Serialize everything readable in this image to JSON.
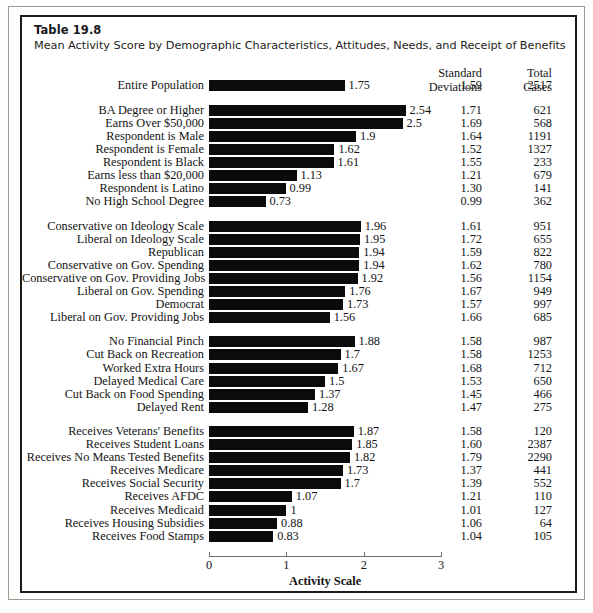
{
  "table": {
    "number_label": "Table 19.8",
    "caption": "Mean Activity Score by Demographic Characteristics, Attitudes, Needs, and Receipt of Benefits",
    "columns": {
      "sd_line1": "Standard",
      "sd_line2": "Deviations",
      "tc_line1": "Total",
      "tc_line2": "Cases"
    }
  },
  "chart_data": {
    "type": "bar",
    "orientation": "horizontal",
    "title": "Mean Activity Score by Demographic Characteristics, Attitudes, Needs, and Receipt of Benefits",
    "subtitle": "Table 19.8",
    "xlabel": "Activity Scale",
    "ylabel": "",
    "xlim": [
      0,
      3
    ],
    "xticks": [
      "0",
      "1",
      "2",
      "3"
    ],
    "grid": false,
    "legend": "none",
    "bar_color": "#0b0b0b",
    "extra_columns": [
      "Standard Deviations",
      "Total Cases"
    ],
    "groups": [
      {
        "name": "overall",
        "rows": [
          {
            "label": "Entire Population",
            "value": 1.75,
            "value_label": "1.75",
            "sd": "1.59",
            "cases": "2517"
          }
        ]
      },
      {
        "name": "demographics",
        "rows": [
          {
            "label": "BA Degree or Higher",
            "value": 2.54,
            "value_label": "2.54",
            "sd": "1.71",
            "cases": "621"
          },
          {
            "label": "Earns Over $50,000",
            "value": 2.5,
            "value_label": "2.5",
            "sd": "1.69",
            "cases": "568"
          },
          {
            "label": "Respondent is Male",
            "value": 1.9,
            "value_label": "1.9",
            "sd": "1.64",
            "cases": "1191"
          },
          {
            "label": "Respondent is Female",
            "value": 1.62,
            "value_label": "1.62",
            "sd": "1.52",
            "cases": "1327"
          },
          {
            "label": "Respondent is Black",
            "value": 1.61,
            "value_label": "1.61",
            "sd": "1.55",
            "cases": "233"
          },
          {
            "label": "Earns less than $20,000",
            "value": 1.13,
            "value_label": "1.13",
            "sd": "1.21",
            "cases": "679"
          },
          {
            "label": "Respondent is Latino",
            "value": 0.99,
            "value_label": "0.99",
            "sd": "1.30",
            "cases": "141"
          },
          {
            "label": "No High School Degree",
            "value": 0.73,
            "value_label": "0.73",
            "sd": "0.99",
            "cases": "362"
          }
        ]
      },
      {
        "name": "attitudes",
        "rows": [
          {
            "label": "Conservative on Ideology Scale",
            "value": 1.96,
            "value_label": "1.96",
            "sd": "1.61",
            "cases": "951"
          },
          {
            "label": "Liberal on Ideology Scale",
            "value": 1.95,
            "value_label": "1.95",
            "sd": "1.72",
            "cases": "655"
          },
          {
            "label": "Republican",
            "value": 1.94,
            "value_label": "1.94",
            "sd": "1.59",
            "cases": "822"
          },
          {
            "label": "Conservative on Gov. Spending",
            "value": 1.94,
            "value_label": "1.94",
            "sd": "1.62",
            "cases": "780"
          },
          {
            "label": "Conservative on Gov. Providing Jobs",
            "value": 1.92,
            "value_label": "1.92",
            "sd": "1.56",
            "cases": "1154"
          },
          {
            "label": "Liberal on Gov. Spending",
            "value": 1.76,
            "value_label": "1.76",
            "sd": "1.67",
            "cases": "949"
          },
          {
            "label": "Democrat",
            "value": 1.73,
            "value_label": "1.73",
            "sd": "1.57",
            "cases": "997"
          },
          {
            "label": "Liberal on Gov. Providing Jobs",
            "value": 1.56,
            "value_label": "1.56",
            "sd": "1.66",
            "cases": "685"
          }
        ]
      },
      {
        "name": "needs",
        "rows": [
          {
            "label": "No Financial Pinch",
            "value": 1.88,
            "value_label": "1.88",
            "sd": "1.58",
            "cases": "987"
          },
          {
            "label": "Cut Back on Recreation",
            "value": 1.7,
            "value_label": "1.7",
            "sd": "1.58",
            "cases": "1253"
          },
          {
            "label": "Worked Extra Hours",
            "value": 1.67,
            "value_label": "1.67",
            "sd": "1.68",
            "cases": "712"
          },
          {
            "label": "Delayed Medical Care",
            "value": 1.5,
            "value_label": "1.5",
            "sd": "1.53",
            "cases": "650"
          },
          {
            "label": "Cut Back on Food Spending",
            "value": 1.37,
            "value_label": "1.37",
            "sd": "1.45",
            "cases": "466"
          },
          {
            "label": "Delayed Rent",
            "value": 1.28,
            "value_label": "1.28",
            "sd": "1.47",
            "cases": "275"
          }
        ]
      },
      {
        "name": "benefits",
        "rows": [
          {
            "label": "Receives Veterans' Benefits",
            "value": 1.87,
            "value_label": "1.87",
            "sd": "1.58",
            "cases": "120"
          },
          {
            "label": "Receives Student Loans",
            "value": 1.85,
            "value_label": "1.85",
            "sd": "1.60",
            "cases": "2387"
          },
          {
            "label": "Receives No Means Tested Benefits",
            "value": 1.82,
            "value_label": "1.82",
            "sd": "1.79",
            "cases": "2290"
          },
          {
            "label": "Receives Medicare",
            "value": 1.73,
            "value_label": "1.73",
            "sd": "1.37",
            "cases": "441"
          },
          {
            "label": "Receives Social Security",
            "value": 1.7,
            "value_label": "1.7",
            "sd": "1.39",
            "cases": "552"
          },
          {
            "label": "Receives AFDC",
            "value": 1.07,
            "value_label": "1.07",
            "sd": "1.21",
            "cases": "110"
          },
          {
            "label": "Receives Medicaid",
            "value": 1,
            "value_label": "1",
            "sd": "1.01",
            "cases": "127"
          },
          {
            "label": "Receives Housing Subsidies",
            "value": 0.88,
            "value_label": "0.88",
            "sd": "1.06",
            "cases": "64"
          },
          {
            "label": "Receives Food Stamps",
            "value": 0.83,
            "value_label": "0.83",
            "sd": "1.04",
            "cases": "105"
          }
        ]
      }
    ]
  }
}
